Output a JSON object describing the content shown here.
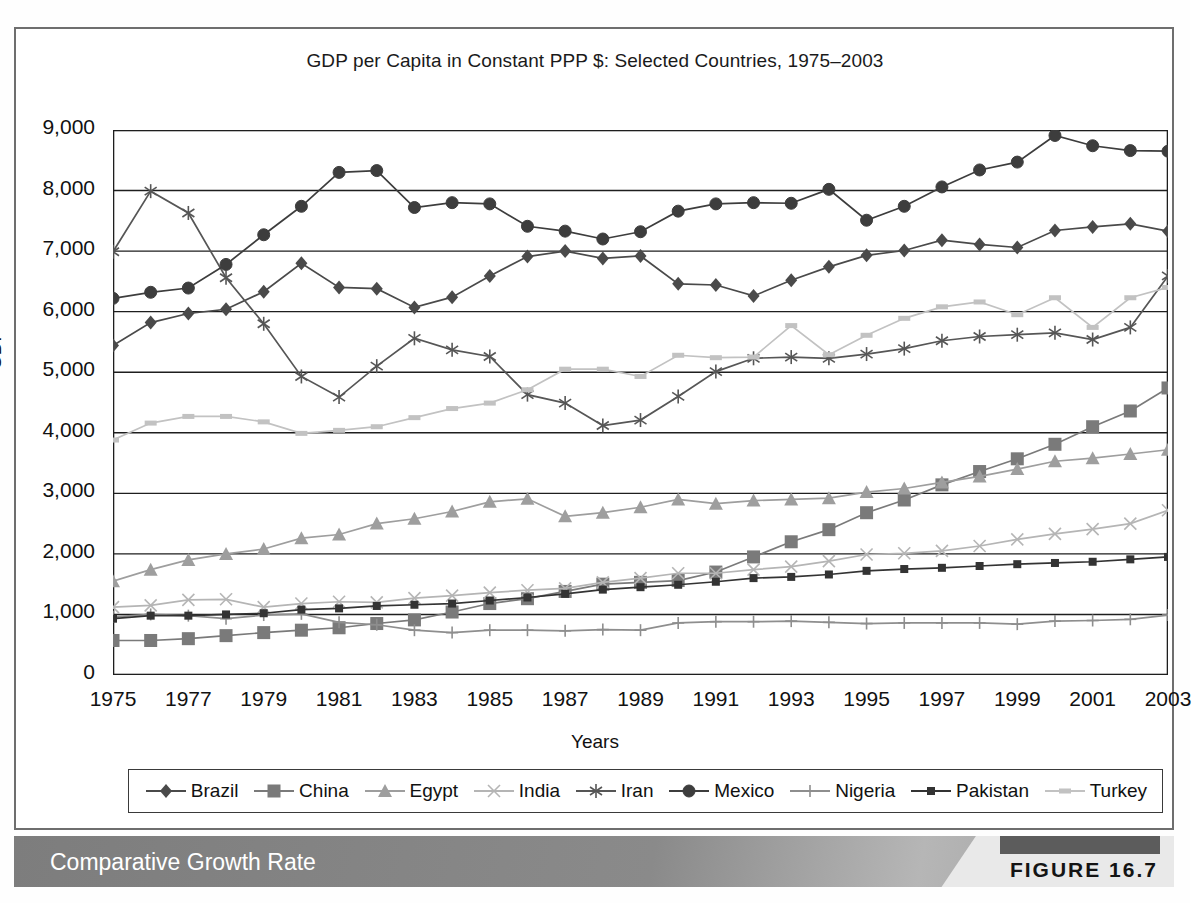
{
  "figure": {
    "caption": "Comparative Growth Rate",
    "number": "FIGURE 16.7"
  },
  "chart_data": {
    "type": "line",
    "title": "GDP per Capita in Constant PPP $: Selected Countries, 1975–2003",
    "xlabel": "Years",
    "ylabel": "GDP",
    "xlim": [
      1975,
      2003
    ],
    "ylim": [
      0,
      9000
    ],
    "ytick_labels": [
      "0",
      "1,000",
      "2,000",
      "3,000",
      "4,000",
      "5,000",
      "6,000",
      "7,000",
      "8,000",
      "9,000"
    ],
    "ytick_values": [
      0,
      1000,
      2000,
      3000,
      4000,
      5000,
      6000,
      7000,
      8000,
      9000
    ],
    "xtick_labels": [
      "1975",
      "1977",
      "1979",
      "1981",
      "1983",
      "1985",
      "1987",
      "1989",
      "1991",
      "1993",
      "1995",
      "1997",
      "1999",
      "2001",
      "2003"
    ],
    "xtick_values": [
      1975,
      1977,
      1979,
      1981,
      1983,
      1985,
      1987,
      1989,
      1991,
      1993,
      1995,
      1997,
      1999,
      2001,
      2003
    ],
    "grid": "horizontal",
    "legend_position": "bottom",
    "x": [
      1975,
      1976,
      1977,
      1978,
      1979,
      1980,
      1981,
      1982,
      1983,
      1984,
      1985,
      1986,
      1987,
      1988,
      1989,
      1990,
      1991,
      1992,
      1993,
      1994,
      1995,
      1996,
      1997,
      1998,
      1999,
      2000,
      2001,
      2002,
      2003
    ],
    "series": [
      {
        "name": "Brazil",
        "marker": "diamond",
        "color": "#4a4a4a",
        "values": [
          5440,
          5820,
          5970,
          6040,
          6330,
          6800,
          6400,
          6380,
          6070,
          6240,
          6590,
          6910,
          7000,
          6880,
          6920,
          6460,
          6440,
          6260,
          6520,
          6740,
          6930,
          7010,
          7180,
          7110,
          7060,
          7340,
          7400,
          7450,
          7330
        ]
      },
      {
        "name": "China",
        "marker": "square",
        "color": "#7a7a7a",
        "values": [
          570,
          570,
          600,
          650,
          700,
          740,
          780,
          850,
          910,
          1040,
          1180,
          1260,
          1380,
          1500,
          1530,
          1560,
          1700,
          1950,
          2200,
          2400,
          2680,
          2890,
          3140,
          3360,
          3570,
          3810,
          4100,
          4360,
          4740
        ]
      },
      {
        "name": "Egypt",
        "marker": "triangle",
        "color": "#9e9e9e",
        "values": [
          1550,
          1740,
          1900,
          2000,
          2080,
          2260,
          2320,
          2500,
          2580,
          2700,
          2860,
          2910,
          2620,
          2680,
          2770,
          2900,
          2830,
          2880,
          2900,
          2920,
          3020,
          3080,
          3180,
          3280,
          3400,
          3530,
          3580,
          3650,
          3720
        ]
      },
      {
        "name": "India",
        "marker": "x",
        "color": "#b5b5b5",
        "values": [
          1120,
          1150,
          1240,
          1250,
          1120,
          1180,
          1210,
          1200,
          1270,
          1310,
          1360,
          1400,
          1430,
          1530,
          1600,
          1680,
          1680,
          1740,
          1790,
          1880,
          1990,
          2010,
          2050,
          2130,
          2240,
          2330,
          2410,
          2500,
          2720
        ]
      },
      {
        "name": "Iran",
        "marker": "asterisk",
        "color": "#565656",
        "values": [
          6990,
          7990,
          7630,
          6560,
          5800,
          4930,
          4590,
          5100,
          5560,
          5370,
          5260,
          4630,
          4490,
          4120,
          4210,
          4600,
          5010,
          5230,
          5250,
          5230,
          5300,
          5390,
          5520,
          5590,
          5620,
          5650,
          5540,
          5740,
          6590
        ]
      },
      {
        "name": "Mexico",
        "marker": "circle",
        "color": "#3d3d3d",
        "values": [
          6220,
          6320,
          6390,
          6780,
          7270,
          7740,
          8300,
          8330,
          7720,
          7800,
          7780,
          7410,
          7330,
          7200,
          7320,
          7660,
          7780,
          7800,
          7790,
          8020,
          7510,
          7740,
          8060,
          8340,
          8470,
          8910,
          8740,
          8660,
          8650
        ]
      },
      {
        "name": "Nigeria",
        "marker": "plus",
        "color": "#8e8e8e",
        "values": [
          960,
          1000,
          980,
          930,
          990,
          1010,
          870,
          830,
          740,
          700,
          740,
          740,
          730,
          750,
          740,
          860,
          880,
          880,
          890,
          870,
          850,
          860,
          860,
          860,
          840,
          890,
          900,
          920,
          990
        ]
      },
      {
        "name": "Pakistan",
        "marker": "small-square",
        "color": "#333333",
        "values": [
          930,
          980,
          980,
          1000,
          1020,
          1080,
          1100,
          1140,
          1160,
          1180,
          1230,
          1280,
          1340,
          1410,
          1450,
          1490,
          1540,
          1600,
          1620,
          1660,
          1720,
          1750,
          1770,
          1800,
          1830,
          1850,
          1870,
          1910,
          1950
        ]
      },
      {
        "name": "Turkey",
        "marker": "dash",
        "color": "#c2c2c2",
        "values": [
          3880,
          4160,
          4270,
          4270,
          4180,
          3990,
          4040,
          4100,
          4250,
          4400,
          4490,
          4710,
          5050,
          5050,
          4930,
          5280,
          5240,
          5250,
          5770,
          5290,
          5610,
          5890,
          6080,
          6160,
          5950,
          6230,
          5740,
          6230,
          6400
        ]
      }
    ]
  },
  "legend": {
    "items": [
      {
        "label": "Brazil"
      },
      {
        "label": "China"
      },
      {
        "label": "Egypt"
      },
      {
        "label": "India"
      },
      {
        "label": "Iran"
      },
      {
        "label": "Mexico"
      },
      {
        "label": "Nigeria"
      },
      {
        "label": "Pakistan"
      },
      {
        "label": "Turkey"
      }
    ]
  }
}
